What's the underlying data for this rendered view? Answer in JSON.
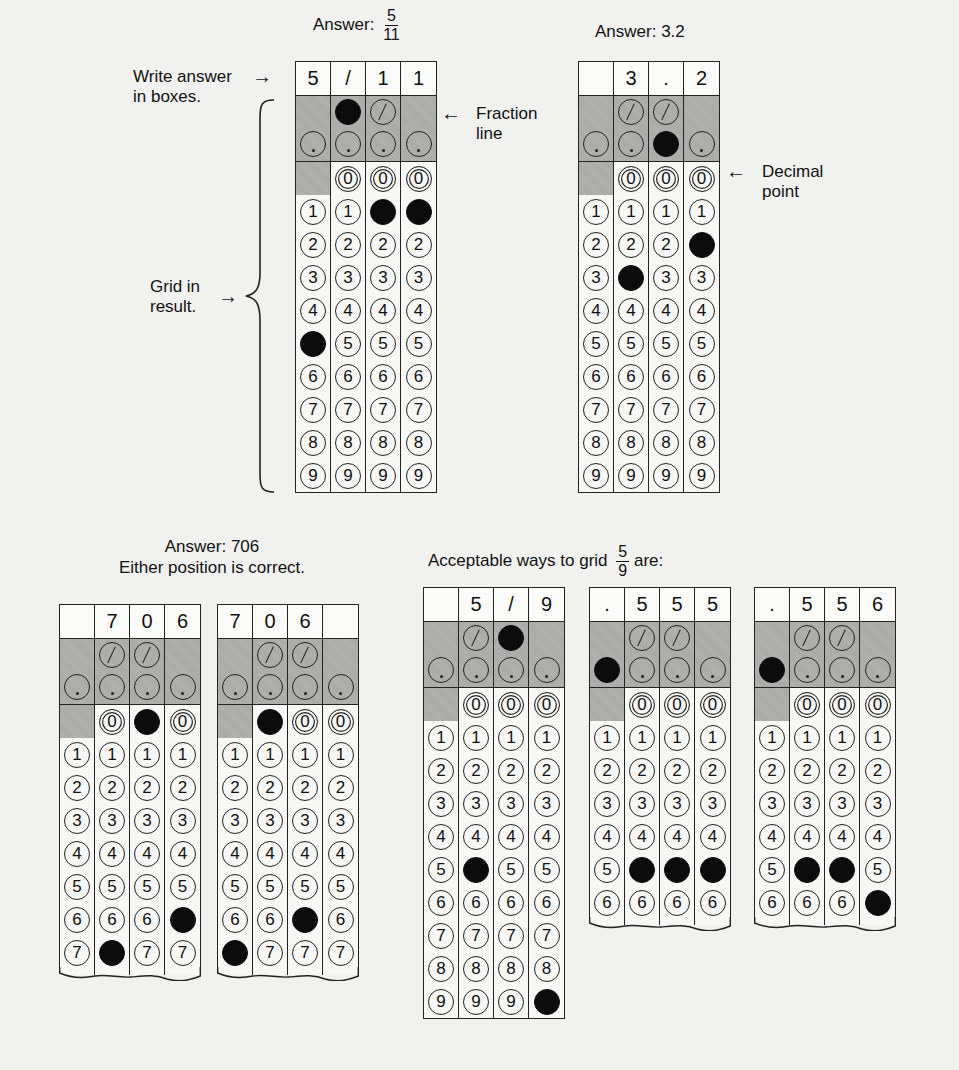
{
  "annotations": {
    "write_answer": [
      "Write answer",
      "in boxes."
    ],
    "write_answer_arrow": "→",
    "grid_in": [
      "Grid in",
      "result."
    ],
    "grid_in_arrow": "→",
    "fraction_line": [
      "Fraction",
      "line"
    ],
    "fraction_line_arrow": "←",
    "decimal_point": [
      "Decimal",
      "point"
    ],
    "decimal_point_arrow": "←"
  },
  "examples": [
    {
      "id": "five-elevenths",
      "title_prefix": "Answer:",
      "title_fraction": {
        "num": "5",
        "den": "11"
      },
      "grids": [
        {
          "boxes": [
            "5",
            "/",
            "1",
            "1"
          ],
          "filled_slash": [
            1
          ],
          "filled_dot": [],
          "filled_digits": [
            5,
            null,
            1,
            1
          ],
          "max_digit": 9,
          "torn": false
        }
      ]
    },
    {
      "id": "three-point-two",
      "title": "Answer: 3.2",
      "grids": [
        {
          "boxes": [
            "",
            "3",
            ".",
            "2"
          ],
          "filled_slash": [],
          "filled_dot": [
            2
          ],
          "filled_digits": [
            null,
            3,
            null,
            2
          ],
          "max_digit": 9,
          "torn": false
        }
      ]
    },
    {
      "id": "seven-oh-six",
      "title": "Answer: 706",
      "subtitle": "Either position is correct.",
      "grids": [
        {
          "boxes": [
            "",
            "7",
            "0",
            "6"
          ],
          "filled_slash": [],
          "filled_dot": [],
          "filled_digits": [
            null,
            7,
            0,
            6
          ],
          "max_digit": 7,
          "torn": true
        },
        {
          "boxes": [
            "7",
            "0",
            "6",
            ""
          ],
          "filled_slash": [],
          "filled_dot": [],
          "filled_digits": [
            7,
            0,
            6,
            null
          ],
          "max_digit": 7,
          "torn": true
        }
      ]
    },
    {
      "id": "five-ninths",
      "title_prefix": "Acceptable ways to grid",
      "title_fraction": {
        "num": "5",
        "den": "9"
      },
      "title_suffix": "are:",
      "grids": [
        {
          "boxes": [
            "",
            "5",
            "/",
            "9"
          ],
          "filled_slash": [
            2
          ],
          "filled_dot": [],
          "filled_digits": [
            null,
            5,
            null,
            9
          ],
          "max_digit": 9,
          "torn": false
        },
        {
          "boxes": [
            ".",
            "5",
            "5",
            "5"
          ],
          "filled_slash": [],
          "filled_dot": [
            0
          ],
          "filled_digits": [
            null,
            5,
            5,
            5
          ],
          "max_digit": 6,
          "torn": true
        },
        {
          "boxes": [
            ".",
            "5",
            "5",
            "6"
          ],
          "filled_slash": [],
          "filled_dot": [
            0
          ],
          "filled_digits": [
            null,
            5,
            5,
            6
          ],
          "max_digit": 6,
          "torn": true
        }
      ]
    }
  ],
  "colors": {
    "background": "#f1f1f0",
    "shade": "#a9a9a7",
    "ink": "#111111",
    "filled_bubble": "#0c0c0c"
  }
}
